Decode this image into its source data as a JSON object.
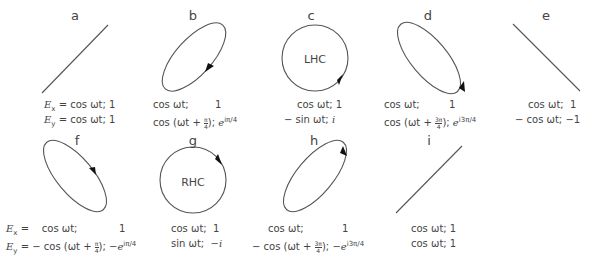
{
  "panels": [
    {
      "id": "a",
      "label": "a",
      "type": "linear",
      "inner_label": "",
      "ex": "Eₓ = cos ωt; 1",
      "ey": "Eᵧ = cos ωt; 1",
      "ex_field": "cos ωt",
      "ex_phasor": "1",
      "ey_field": "cos ωt",
      "ey_phasor": "1"
    },
    {
      "id": "b",
      "label": "b",
      "type": "elliptical",
      "inner_label": "",
      "ex_field": "cos ωt;",
      "ex_phasor": "1",
      "ey_field": "cos (ωt + π/4);",
      "ey_phasor": "e^{iπ/4}"
    },
    {
      "id": "c",
      "label": "c",
      "type": "circular",
      "inner_label": "LHC",
      "ex_field": "cos ωt;",
      "ex_phasor": "1",
      "ey_field": "− sin ωt;",
      "ey_phasor": "i"
    },
    {
      "id": "d",
      "label": "d",
      "type": "elliptical",
      "inner_label": "",
      "ex_field": "cos ωt;",
      "ex_phasor": "1",
      "ey_field": "cos (ωt + 3π/4);",
      "ey_phasor": "e^{i3π/4}"
    },
    {
      "id": "e",
      "label": "e",
      "type": "linear",
      "inner_label": "",
      "ex_field": "cos ωt;",
      "ex_phasor": "1",
      "ey_field": "− cos ωt;",
      "ey_phasor": "−1"
    },
    {
      "id": "f",
      "label": "f",
      "type": "elliptical",
      "inner_label": "",
      "ex_prefix": "Eₓ =",
      "ey_prefix": "Eᵧ = −",
      "ex_field": "cos ωt;",
      "ex_phasor": "1",
      "ey_field": "cos (ωt + π/4);",
      "ey_phasor": "−e^{iπ/4}"
    },
    {
      "id": "g",
      "label": "g",
      "type": "circular",
      "inner_label": "RHC",
      "ex_field": "cos ωt;",
      "ex_phasor": "1",
      "ey_field": "sin ωt;",
      "ey_phasor": "−i"
    },
    {
      "id": "h",
      "label": "h",
      "type": "elliptical",
      "inner_label": "",
      "ex_field": "cos ωt;",
      "ex_phasor": "1",
      "ey_field": "− cos (ωt + 3π/4);",
      "ey_phasor": "−e^{i3π/4}"
    },
    {
      "id": "i",
      "label": "i",
      "type": "linear",
      "inner_label": "",
      "ex_field": "cos ωt;",
      "ex_phasor": "1",
      "ey_field": "cos ωt;",
      "ey_phasor": "1"
    }
  ],
  "text": {
    "a_label": "a",
    "b_label": "b",
    "c_label": "c",
    "d_label": "d",
    "e_label": "e",
    "f_label": "f",
    "g_label": "g",
    "h_label": "h",
    "i_label": "i",
    "c_inner": "LHC",
    "g_inner": "RHC",
    "ex_sym": "E",
    "x_sub": "x",
    "ey_sym": "E",
    "y_sub": "y",
    "equals": "=",
    "minus": "−",
    "cos_wt": "cos ωt;",
    "sin_wt": "sin ωt;",
    "neg_sin_wt": "− sin ωt;",
    "neg_cos_wt": "− cos ωt;",
    "one": "1",
    "i_unit": "i",
    "neg_i": "−i",
    "neg_one": "−1",
    "cos_open": "cos (ωt + ",
    "close": ");",
    "pi": "π",
    "three_pi": "3π",
    "four": "4",
    "e": "e",
    "sup_pi4": "iπ/4",
    "sup_3pi4": "i3π/4",
    "neg_e": "−e",
    "cos_wt_1": "cos ωt; 1",
    "ex_a": "= cos ωt; 1"
  },
  "colors": {
    "stroke": "#555555",
    "arrow": "#111111",
    "text": "#444444",
    "background": "#ffffff"
  }
}
